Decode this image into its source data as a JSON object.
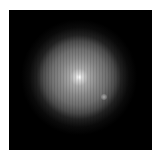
{
  "image": {
    "description": "Grayscale radial glow centered on a black square, white surround",
    "colors": {
      "background": "#ffffff",
      "frame": "#000000",
      "glow_center": "#ffffff"
    }
  }
}
